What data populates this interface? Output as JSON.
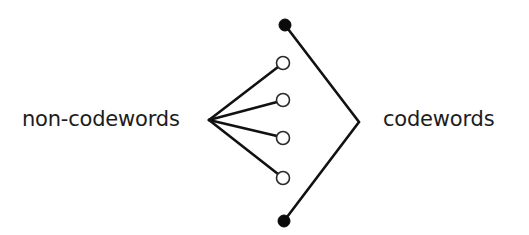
{
  "labels": {
    "left": "non-codewords",
    "right": "codewords"
  },
  "colors": {
    "line": "#111111",
    "filled_node": "#0a0a0a",
    "open_node_stroke": "#2a2a2a",
    "background": "#ffffff",
    "text": "#1c1c1c"
  },
  "nodes": {
    "codewords": [
      {
        "name": "codeword-node-top",
        "cx": 285,
        "cy": 25,
        "r": 6,
        "filled": true
      },
      {
        "name": "codeword-node-bottom",
        "cx": 284,
        "cy": 221,
        "r": 6,
        "filled": true
      }
    ],
    "non_codewords": [
      {
        "name": "non-codeword-node-1",
        "cx": 283,
        "cy": 63,
        "r": 6.5,
        "filled": false
      },
      {
        "name": "non-codeword-node-2",
        "cx": 283,
        "cy": 100,
        "r": 6.5,
        "filled": false
      },
      {
        "name": "non-codeword-node-3",
        "cx": 283,
        "cy": 138,
        "r": 6.5,
        "filled": false
      },
      {
        "name": "non-codeword-node-4",
        "cx": 283,
        "cy": 178,
        "r": 6.5,
        "filled": false
      }
    ]
  },
  "junctions": {
    "left_fan_point": {
      "x": 209,
      "y": 120
    },
    "right_apex": {
      "x": 359,
      "y": 122
    }
  }
}
